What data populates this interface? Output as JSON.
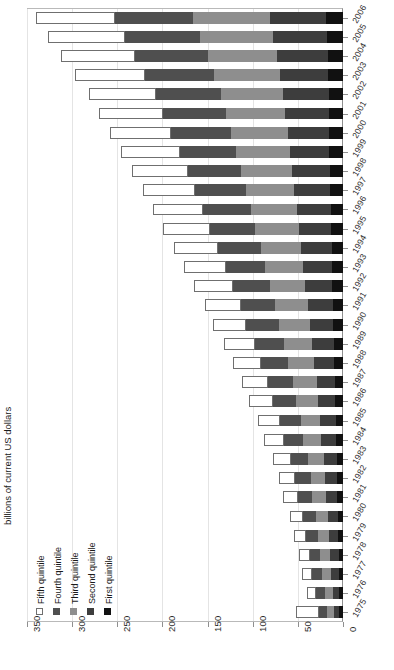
{
  "chart_data": {
    "type": "bar",
    "subtype": "stacked-horizontal-bar",
    "title": "",
    "subtitle": "",
    "xlabel": "billions of current US dollars",
    "ylabel": "",
    "xlim": [
      0,
      350
    ],
    "xticks": [
      0,
      50,
      100,
      150,
      200,
      250,
      300,
      350
    ],
    "xtick_labels": [
      "0",
      "50",
      "100",
      "150",
      "200",
      "250",
      "300",
      "350"
    ],
    "x_axis_direction": "right-to-left",
    "grid": true,
    "legend_position": "bottom-left",
    "categories": [
      "2006",
      "2005",
      "2004",
      "2003",
      "2002",
      "2001",
      "2000",
      "1999",
      "1998",
      "1997",
      "1996",
      "1995",
      "1994",
      "1993",
      "1992",
      "1991",
      "1990",
      "1989",
      "1988",
      "1987",
      "1986",
      "1985",
      "1984",
      "1983",
      "1982",
      "1981",
      "1980",
      "1979",
      "1978",
      "1977",
      "1976",
      "1975"
    ],
    "series": [
      {
        "name": "First quintile",
        "color": "#111111",
        "values": [
          19,
          18,
          17,
          17,
          16,
          16,
          15,
          15,
          14,
          14,
          13,
          13,
          12,
          12,
          12,
          11,
          11,
          10,
          10,
          9,
          9,
          8,
          8,
          7,
          7,
          7,
          6,
          6,
          5,
          5,
          4,
          4
        ]
      },
      {
        "name": "Second quintile",
        "color": "#3d3d3d",
        "values": [
          62,
          59,
          56,
          53,
          50,
          48,
          46,
          44,
          42,
          40,
          38,
          36,
          34,
          32,
          30,
          28,
          26,
          24,
          22,
          20,
          19,
          17,
          16,
          14,
          13,
          12,
          11,
          10,
          9,
          8,
          7,
          6
        ]
      },
      {
        "name": "Third quintile",
        "color": "#8e8e8e",
        "values": [
          85,
          81,
          77,
          73,
          69,
          66,
          63,
          60,
          57,
          54,
          51,
          48,
          45,
          42,
          39,
          36,
          34,
          31,
          29,
          26,
          24,
          22,
          20,
          18,
          16,
          15,
          13,
          12,
          11,
          10,
          9,
          8
        ]
      },
      {
        "name": "Fourth quintile",
        "color": "#4f4f4f",
        "values": [
          87,
          84,
          80,
          76,
          72,
          69,
          66,
          62,
          59,
          56,
          53,
          50,
          47,
          44,
          41,
          38,
          36,
          33,
          30,
          28,
          26,
          23,
          21,
          19,
          17,
          16,
          14,
          13,
          12,
          11,
          10,
          9
        ]
      },
      {
        "name": "Fifth quintile",
        "color": "#ffffff",
        "values": [
          87,
          85,
          82,
          78,
          74,
          71,
          68,
          65,
          62,
          58,
          55,
          52,
          49,
          46,
          43,
          40,
          37,
          34,
          31,
          29,
          26,
          24,
          22,
          20,
          18,
          16,
          15,
          13,
          12,
          11,
          10,
          25
        ]
      }
    ],
    "totals": [
      340,
      327,
      312,
      297,
      281,
      270,
      258,
      246,
      234,
      222,
      210,
      199,
      187,
      176,
      165,
      153,
      144,
      132,
      122,
      112,
      104,
      94,
      87,
      78,
      71,
      66,
      59,
      54,
      49,
      45,
      40,
      52
    ]
  },
  "legend": {
    "items": [
      {
        "label": "Fifth quintile",
        "color": "#ffffff",
        "outline": true
      },
      {
        "label": "Fourth quintile",
        "color": "#4f4f4f",
        "outline": false
      },
      {
        "label": "Third quintile",
        "color": "#8e8e8e",
        "outline": false
      },
      {
        "label": "Second quintile",
        "color": "#3d3d3d",
        "outline": false
      },
      {
        "label": "First quintile",
        "color": "#111111",
        "outline": false
      }
    ]
  },
  "axis_title": "billions of current US dollars"
}
